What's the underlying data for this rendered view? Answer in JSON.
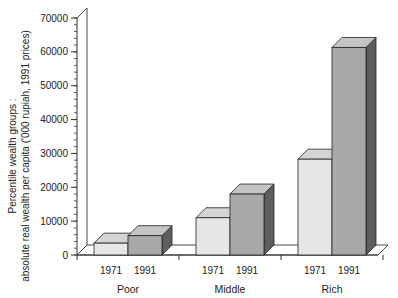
{
  "chart_data": {
    "type": "bar",
    "style": "3d-clustered",
    "title": "",
    "xlabel": "",
    "ylabel_line1": "Percentile wealth groups :",
    "ylabel_line2": "absolute real wealth per capita ('000 rupiah, 1991 prices)",
    "ylim": [
      0,
      70000
    ],
    "yticks": [
      0,
      10000,
      20000,
      30000,
      40000,
      50000,
      60000,
      70000
    ],
    "minor_tick_step": 2000,
    "grid": false,
    "legend": null,
    "categories": [
      "Poor",
      "Middle",
      "Rich"
    ],
    "series": [
      {
        "name": "1971",
        "values": [
          3500,
          11000,
          28300
        ],
        "color": "#e6e6e6",
        "top_color": "#d4d4d4",
        "side_color": "#b8b8b8"
      },
      {
        "name": "1991",
        "values": [
          5700,
          18000,
          61300
        ],
        "color": "#a9a9a9",
        "top_color": "#c4c4c4",
        "side_color": "#5e5e5e"
      }
    ]
  }
}
